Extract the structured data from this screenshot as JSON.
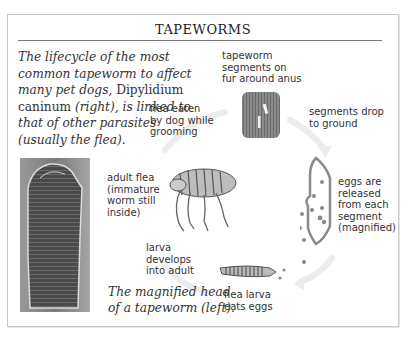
{
  "title": "TAPEWORMS",
  "intro": {
    "italic_part1": "The lifecycle of the most common tapeworm to affect many pet dogs,",
    "species": "Dipylidium caninum",
    "italic_part2": "(right), is linked to that of other parasites (usually the flea)."
  },
  "labels": {
    "segments_on_fur": "tapeworm\nsegments on\nfur around anus",
    "flea_eaten": "flea eaten\nby dog while\ngrooming",
    "segments_drop": "segments drop\nto ground",
    "adult_flea": "adult flea\n(immature\nworm still\ninside)",
    "eggs_released": "eggs are\nreleased\nfrom each\nsegment\n(magnified)",
    "larva_develops": "larva\ndevelops\ninto adult",
    "flea_larva": "flea larva\neats eggs"
  },
  "caption": "The magnified head\nof a tapeworm (left).",
  "colors": {
    "frame": "#c9c9c9",
    "text": "#333333",
    "arrow": "#ececec",
    "segment_outline": "#8a8a8a"
  }
}
